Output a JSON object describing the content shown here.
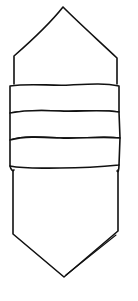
{
  "canvas": {
    "width": 138,
    "height": 301,
    "background": "#ffffff",
    "stroke_color": "#111111"
  },
  "figure": {
    "parts": [
      {
        "name": "top-point",
        "apex": [
          63,
          7
        ]
      },
      {
        "name": "upper-body",
        "left_x": 14,
        "right_x": 117,
        "top_y": 57,
        "bottom_y": 84
      },
      {
        "name": "band-1",
        "y_top": 84,
        "y_bottom": 112
      },
      {
        "name": "band-2",
        "y_top": 112,
        "y_bottom": 140
      },
      {
        "name": "band-3",
        "y_top": 140,
        "y_bottom": 168
      },
      {
        "name": "lower-body",
        "left_x": 12,
        "right_x": 118,
        "top_y": 168,
        "bottom_y": 235
      },
      {
        "name": "bottom-point",
        "apex": [
          64,
          277
        ]
      }
    ],
    "band_count": 3
  }
}
